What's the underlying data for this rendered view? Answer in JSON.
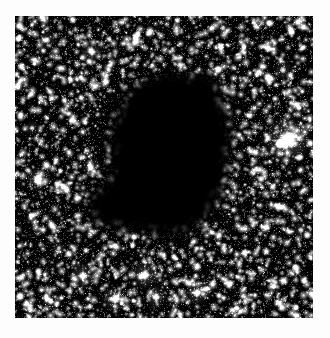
{
  "figure": {
    "kind": "astronomical-image",
    "caption": "",
    "background_color": "#ffffff",
    "sky_color": "#000000",
    "star_color": "#ffffff"
  },
  "plate": {
    "x": 15,
    "y": 16,
    "width": 298,
    "height": 302,
    "border_color": "#000000"
  },
  "chart_data": {
    "type": "scatter",
    "title": "",
    "subtitle": "",
    "xlabel": "",
    "ylabel": "",
    "xlim": [
      0,
      298
    ],
    "ylim": [
      0,
      302
    ],
    "grid": false,
    "legend": null,
    "background": "#000000",
    "point_color": "#ffffff",
    "field": {
      "description": "dense uniform star field",
      "star_count": 5200,
      "faint_star_count": 9000,
      "seed": 20240517
    },
    "dark_nebula": {
      "name": "dark-nebula-silhouette",
      "fill": "#000000",
      "description": "irregular opaque globule occupying the centre, with a lobe extending to the lower left",
      "outline_polygon": [
        [
          120,
          68
        ],
        [
          138,
          58
        ],
        [
          158,
          54
        ],
        [
          176,
          58
        ],
        [
          190,
          52
        ],
        [
          200,
          60
        ],
        [
          206,
          74
        ],
        [
          212,
          88
        ],
        [
          216,
          104
        ],
        [
          218,
          122
        ],
        [
          216,
          140
        ],
        [
          214,
          156
        ],
        [
          212,
          170
        ],
        [
          206,
          184
        ],
        [
          198,
          196
        ],
        [
          190,
          206
        ],
        [
          180,
          214
        ],
        [
          168,
          220
        ],
        [
          154,
          222
        ],
        [
          140,
          220
        ],
        [
          128,
          216
        ],
        [
          116,
          214
        ],
        [
          104,
          214
        ],
        [
          92,
          212
        ],
        [
          80,
          208
        ],
        [
          72,
          200
        ],
        [
          70,
          190
        ],
        [
          74,
          180
        ],
        [
          82,
          172
        ],
        [
          90,
          166
        ],
        [
          94,
          156
        ],
        [
          94,
          144
        ],
        [
          92,
          130
        ],
        [
          94,
          116
        ],
        [
          98,
          100
        ],
        [
          104,
          86
        ],
        [
          112,
          75
        ]
      ],
      "centroid": [
        146,
        138
      ],
      "approx_extent_px": [
        150,
        168
      ]
    },
    "bright_stars": [
      {
        "id": "star-a",
        "x": 272,
        "y": 124,
        "brightness": 1.0,
        "radius": 9.5,
        "glow": 26,
        "label": "brightest field star"
      },
      {
        "id": "star-b",
        "x": 68,
        "y": 260,
        "brightness": 0.82,
        "radius": 5.0,
        "glow": 14,
        "label": ""
      },
      {
        "id": "star-c",
        "x": 130,
        "y": 259,
        "brightness": 0.86,
        "radius": 5.2,
        "glow": 15,
        "label": ""
      },
      {
        "id": "star-d",
        "x": 100,
        "y": 283,
        "brightness": 0.84,
        "radius": 5.0,
        "glow": 14,
        "label": ""
      },
      {
        "id": "star-e",
        "x": 141,
        "y": 281,
        "brightness": 0.78,
        "radius": 4.4,
        "glow": 12,
        "label": ""
      },
      {
        "id": "star-f",
        "x": 182,
        "y": 277,
        "brightness": 0.8,
        "radius": 4.6,
        "glow": 13,
        "label": ""
      },
      {
        "id": "star-g",
        "x": 191,
        "y": 273,
        "brightness": 0.72,
        "radius": 3.6,
        "glow": 10,
        "label": ""
      },
      {
        "id": "star-h",
        "x": 23,
        "y": 163,
        "brightness": 0.8,
        "radius": 4.6,
        "glow": 13,
        "label": ""
      },
      {
        "id": "star-i",
        "x": 77,
        "y": 36,
        "brightness": 0.76,
        "radius": 4.2,
        "glow": 12,
        "label": ""
      },
      {
        "id": "star-j",
        "x": 32,
        "y": 24,
        "brightness": 0.7,
        "radius": 3.6,
        "glow": 10,
        "label": ""
      },
      {
        "id": "star-k",
        "x": 76,
        "y": 151,
        "brightness": 0.74,
        "radius": 4.0,
        "glow": 11,
        "label": ""
      },
      {
        "id": "star-l",
        "x": 48,
        "y": 170,
        "brightness": 0.66,
        "radius": 3.4,
        "glow": 9,
        "label": ""
      },
      {
        "id": "star-m",
        "x": 246,
        "y": 163,
        "brightness": 0.72,
        "radius": 3.8,
        "glow": 11,
        "label": ""
      },
      {
        "id": "star-n",
        "x": 268,
        "y": 54,
        "brightness": 0.7,
        "radius": 3.6,
        "glow": 10,
        "label": ""
      },
      {
        "id": "star-o",
        "x": 229,
        "y": 30,
        "brightness": 0.66,
        "radius": 3.3,
        "glow": 9,
        "label": ""
      },
      {
        "id": "star-p",
        "x": 208,
        "y": 12,
        "brightness": 0.64,
        "radius": 3.1,
        "glow": 8,
        "label": ""
      },
      {
        "id": "star-q",
        "x": 66,
        "y": 62,
        "brightness": 0.68,
        "radius": 3.4,
        "glow": 9,
        "label": ""
      },
      {
        "id": "star-r",
        "x": 17,
        "y": 112,
        "brightness": 0.62,
        "radius": 3.0,
        "glow": 8,
        "label": ""
      },
      {
        "id": "star-s",
        "x": 286,
        "y": 214,
        "brightness": 0.66,
        "radius": 3.3,
        "glow": 9,
        "label": ""
      },
      {
        "id": "star-t",
        "x": 259,
        "y": 270,
        "brightness": 0.64,
        "radius": 3.1,
        "glow": 8,
        "label": ""
      },
      {
        "id": "star-u",
        "x": 222,
        "y": 292,
        "brightness": 0.62,
        "radius": 3.0,
        "glow": 8,
        "label": ""
      },
      {
        "id": "star-v",
        "x": 36,
        "y": 286,
        "brightness": 0.64,
        "radius": 3.2,
        "glow": 9,
        "label": ""
      },
      {
        "id": "star-w",
        "x": 160,
        "y": 42,
        "brightness": 0.58,
        "radius": 2.8,
        "glow": 7,
        "label": ""
      },
      {
        "id": "star-x",
        "x": 120,
        "y": 22,
        "brightness": 0.6,
        "radius": 2.9,
        "glow": 7,
        "label": ""
      },
      {
        "id": "star-y",
        "x": 284,
        "y": 92,
        "brightness": 0.62,
        "radius": 3.0,
        "glow": 8,
        "label": ""
      },
      {
        "id": "star-z",
        "x": 44,
        "y": 232,
        "brightness": 0.58,
        "radius": 2.8,
        "glow": 7,
        "label": ""
      }
    ]
  }
}
